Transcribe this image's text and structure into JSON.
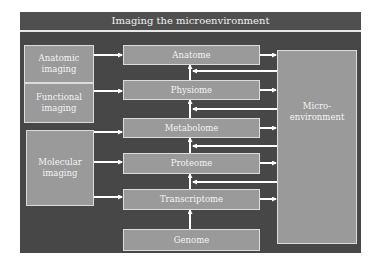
{
  "title": "Imaging the microenvironment",
  "imaging_modalities": [
    {
      "label": "Anatomic imaging",
      "line1": "Anatomic",
      "line2": "imaging"
    },
    {
      "label": "Functional imaging",
      "line1": "Functional",
      "line2": "imaging"
    },
    {
      "label": "Molecular imaging",
      "line1": "Molecular",
      "line2": "imaging"
    }
  ],
  "omics_levels": [
    {
      "label": "Anatome"
    },
    {
      "label": "Physiome"
    },
    {
      "label": "Metabolome"
    },
    {
      "label": "Proteome"
    },
    {
      "label": "Transcriptome"
    },
    {
      "label": "Genome"
    }
  ],
  "microenvironment": {
    "line1": "Micro-",
    "line2": "environment"
  },
  "connections": {
    "imaging_to_omics": [
      {
        "from": "Anatomic imaging",
        "to": "Anatome"
      },
      {
        "from": "Functional imaging",
        "to": "Physiome"
      },
      {
        "from": "Molecular imaging",
        "to": "Metabolome"
      },
      {
        "from": "Molecular imaging",
        "to": "Proteome"
      },
      {
        "from": "Molecular imaging",
        "to": "Transcriptome"
      }
    ],
    "upward_flow": [
      "Genome",
      "Transcriptome",
      "Proteome",
      "Metabolome",
      "Physiome",
      "Anatome"
    ],
    "omics_to_microenvironment": [
      "Anatome",
      "Physiome",
      "Metabolome",
      "Proteome",
      "Transcriptome"
    ],
    "microenvironment_feedback": [
      "Anatome-Physiome",
      "Physiome-Metabolome",
      "Metabolome-Proteome",
      "Proteome-Transcriptome"
    ]
  },
  "colors": {
    "background": "#474747",
    "box_fill": "#9a9a9a",
    "arrow": "#ffffff",
    "text": "#f4f4f4"
  }
}
